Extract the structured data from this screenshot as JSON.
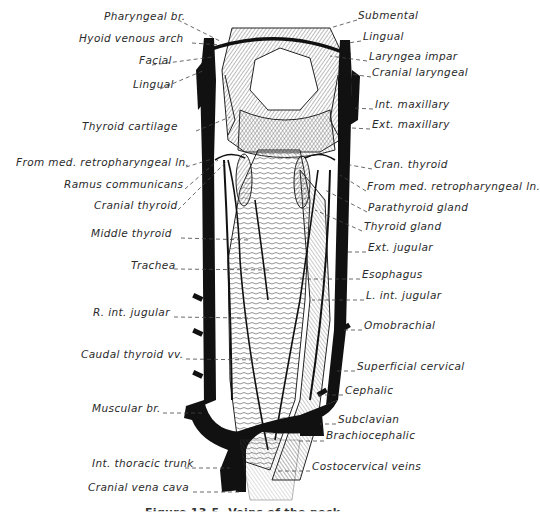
{
  "figure": {
    "caption_partial": "Figure 13-5. Veins of the neck",
    "line_color": "#111111",
    "background": "#ffffff"
  },
  "labels_left": [
    {
      "id": "pharyngeal-br",
      "text": "Pharyngeal br.",
      "x": 104,
      "y": 16
    },
    {
      "id": "hyoid-venous-arch",
      "text": "Hyoid venous arch",
      "x": 79,
      "y": 38
    },
    {
      "id": "facial",
      "text": "Facial",
      "x": 139,
      "y": 60
    },
    {
      "id": "lingual-left",
      "text": "Lingual",
      "x": 133,
      "y": 84
    },
    {
      "id": "thyroid-cartilage",
      "text": "Thyroid cartilage",
      "x": 82,
      "y": 126
    },
    {
      "id": "from-med-retropharyngeal-ln-left",
      "text": "From med. retropharyngeal ln.",
      "x": 16,
      "y": 162
    },
    {
      "id": "ramus-communicans",
      "text": "Ramus communicans",
      "x": 64,
      "y": 184
    },
    {
      "id": "cranial-thyroid",
      "text": "Cranial thyroid",
      "x": 94,
      "y": 205
    },
    {
      "id": "middle-thyroid",
      "text": "Middle thyroid",
      "x": 91,
      "y": 233
    },
    {
      "id": "trachea",
      "text": "Trachea",
      "x": 131,
      "y": 265
    },
    {
      "id": "r-int-jugular",
      "text": "R. int. jugular",
      "x": 93,
      "y": 312
    },
    {
      "id": "caudal-thyroid-vv",
      "text": "Caudal thyroid vv.",
      "x": 81,
      "y": 354
    },
    {
      "id": "muscular-br",
      "text": "Muscular br.",
      "x": 92,
      "y": 408
    },
    {
      "id": "int-thoracic-trunk",
      "text": "Int. thoracic trunk",
      "x": 92,
      "y": 463
    },
    {
      "id": "cranial-vena-cava",
      "text": "Cranial vena cava",
      "x": 88,
      "y": 487
    }
  ],
  "labels_right": [
    {
      "id": "submental",
      "text": "Submental",
      "x": 358,
      "y": 15
    },
    {
      "id": "lingual-right",
      "text": "Lingual",
      "x": 363,
      "y": 36
    },
    {
      "id": "laryngea-impar",
      "text": "Laryngea impar",
      "x": 369,
      "y": 56
    },
    {
      "id": "cranial-laryngeal",
      "text": "Cranial laryngeal",
      "x": 372,
      "y": 72
    },
    {
      "id": "int-maxillary",
      "text": "Int. maxillary",
      "x": 375,
      "y": 104
    },
    {
      "id": "ext-maxillary",
      "text": "Ext. maxillary",
      "x": 372,
      "y": 124
    },
    {
      "id": "cran-thyroid",
      "text": "Cran. thyroid",
      "x": 374,
      "y": 164
    },
    {
      "id": "from-med-retropharyngeal-ln-right",
      "text": "From med. retropharyngeal ln.",
      "x": 367,
      "y": 186
    },
    {
      "id": "parathyroid-gland",
      "text": "Parathyroid gland",
      "x": 368,
      "y": 207
    },
    {
      "id": "thyroid-gland",
      "text": "Thyroid gland",
      "x": 364,
      "y": 226
    },
    {
      "id": "ext-jugular",
      "text": "Ext. jugular",
      "x": 368,
      "y": 247
    },
    {
      "id": "esophagus",
      "text": "Esophagus",
      "x": 362,
      "y": 274
    },
    {
      "id": "l-int-jugular",
      "text": "L. int. jugular",
      "x": 366,
      "y": 295
    },
    {
      "id": "omobrachial",
      "text": "Omobrachial",
      "x": 364,
      "y": 325
    },
    {
      "id": "superficial-cervical",
      "text": "Superficial cervical",
      "x": 357,
      "y": 366
    },
    {
      "id": "cephalic",
      "text": "Cephalic",
      "x": 345,
      "y": 390
    },
    {
      "id": "subclavian",
      "text": "Subclavian",
      "x": 338,
      "y": 419
    },
    {
      "id": "brachiocephalic",
      "text": "Brachiocephalic",
      "x": 326,
      "y": 435
    },
    {
      "id": "costocervical-veins",
      "text": "Costocervical veins",
      "x": 312,
      "y": 466
    }
  ],
  "leaders_left": [
    [
      178,
      20,
      222,
      42
    ],
    [
      192,
      43,
      222,
      45
    ],
    [
      152,
      65,
      212,
      57
    ],
    [
      160,
      89,
      205,
      70
    ],
    [
      196,
      131,
      230,
      117
    ],
    [
      186,
      167,
      212,
      159
    ],
    [
      185,
      189,
      218,
      160
    ],
    [
      178,
      210,
      226,
      162
    ],
    [
      181,
      238,
      248,
      240
    ],
    [
      174,
      269,
      270,
      270
    ],
    [
      174,
      317,
      248,
      318
    ],
    [
      186,
      359,
      258,
      360
    ],
    [
      163,
      413,
      205,
      413
    ],
    [
      185,
      468,
      230,
      468
    ],
    [
      193,
      492,
      240,
      492
    ]
  ],
  "leaders_right": [
    [
      357,
      20,
      330,
      28
    ],
    [
      361,
      41,
      348,
      43
    ],
    [
      367,
      61,
      330,
      56
    ],
    [
      371,
      77,
      350,
      74
    ],
    [
      373,
      109,
      352,
      108
    ],
    [
      370,
      129,
      352,
      128
    ],
    [
      372,
      169,
      350,
      165
    ],
    [
      366,
      191,
      340,
      175
    ],
    [
      367,
      212,
      325,
      190
    ],
    [
      362,
      231,
      315,
      210
    ],
    [
      366,
      252,
      347,
      252
    ],
    [
      360,
      279,
      300,
      279
    ],
    [
      364,
      300,
      312,
      300
    ],
    [
      362,
      330,
      342,
      330
    ],
    [
      355,
      371,
      335,
      371
    ],
    [
      343,
      395,
      317,
      395
    ],
    [
      336,
      424,
      320,
      424
    ],
    [
      324,
      441,
      296,
      441
    ],
    [
      310,
      471,
      278,
      471
    ]
  ]
}
